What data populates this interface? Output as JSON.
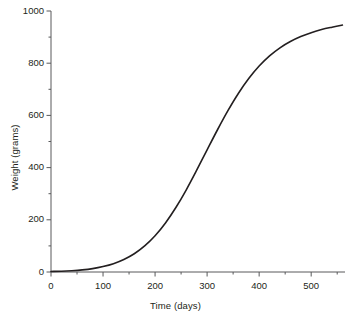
{
  "figure": {
    "background_color": "#ffffff",
    "axis_color": "#58595b",
    "curve_color": "#231f20",
    "text_color": "#231f20"
  },
  "chart_data": {
    "type": "line",
    "title": "",
    "subtitle": "",
    "xlabel": "Time (days)",
    "ylabel": "Weight (grams)",
    "xlim": [
      0,
      565
    ],
    "ylim": [
      0,
      1000
    ],
    "grid": false,
    "legend": null,
    "annotations": [],
    "x_ticks_major": [
      0,
      100,
      200,
      300,
      400,
      500
    ],
    "x_tick_labels": [
      "0",
      "100",
      "200",
      "300",
      "400",
      "500"
    ],
    "x_ticks_minor": [
      50,
      150,
      250,
      350,
      450,
      550
    ],
    "y_ticks_major": [
      0,
      200,
      400,
      600,
      800,
      1000
    ],
    "y_tick_labels": [
      "0",
      "200",
      "400",
      "600",
      "800",
      "1000"
    ],
    "y_ticks_minor": [
      100,
      300,
      500,
      700,
      900
    ],
    "series": [
      {
        "name": "Growth curve",
        "color": "#231f20",
        "line_width": 1.6,
        "x": [
          0,
          20,
          40,
          60,
          80,
          100,
          120,
          140,
          160,
          180,
          200,
          220,
          240,
          260,
          280,
          300,
          320,
          340,
          360,
          380,
          400,
          420,
          440,
          460,
          480,
          500,
          520,
          540,
          560
        ],
        "y": [
          2,
          3,
          5,
          8,
          13,
          21,
          32,
          48,
          70,
          100,
          139,
          188,
          247,
          315,
          390,
          468,
          545,
          618,
          684,
          741,
          789,
          828,
          859,
          883,
          902,
          917,
          929,
          938,
          946
        ]
      }
    ]
  },
  "axis_titles": {
    "x": "Time (days)",
    "y": "Weight (grams)"
  }
}
